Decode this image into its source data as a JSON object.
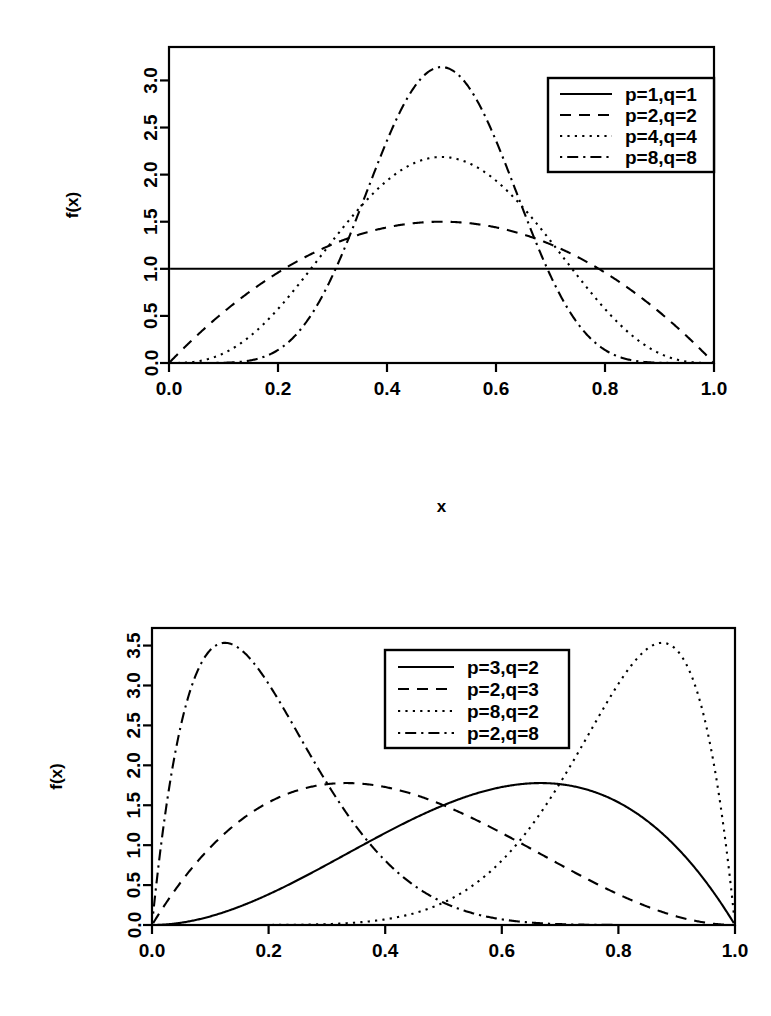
{
  "figures": [
    {
      "id": "beta-symmetric",
      "xlabel": "x",
      "ylabel": "f(x)",
      "xticks": [
        "0.0",
        "0.2",
        "0.4",
        "0.6",
        "0.8",
        "1.0"
      ],
      "yticks": [
        "0.0",
        "0.5",
        "1.0",
        "1.5",
        "2.0",
        "2.5",
        "3.0"
      ],
      "legend": [
        {
          "label": "p=1,q=1",
          "style": "solid"
        },
        {
          "label": "p=2,q=2",
          "style": "dashed"
        },
        {
          "label": "p=4,q=4",
          "style": "dotted"
        },
        {
          "label": "p=8,q=8",
          "style": "dashdot"
        }
      ]
    },
    {
      "id": "beta-skewed",
      "xlabel": "x",
      "ylabel": "f(x)",
      "xticks": [
        "0.0",
        "0.2",
        "0.4",
        "0.6",
        "0.8",
        "1.0"
      ],
      "yticks": [
        "0.0",
        "0.5",
        "1.0",
        "1.5",
        "2.0",
        "2.5",
        "3.0",
        "3.5"
      ],
      "legend": [
        {
          "label": "p=3,q=2",
          "style": "solid"
        },
        {
          "label": "p=2,q=3",
          "style": "dashed"
        },
        {
          "label": "p=8,q=2",
          "style": "dotted"
        },
        {
          "label": "p=2,q=8",
          "style": "dashdot"
        }
      ]
    }
  ],
  "chart_data": [
    {
      "type": "line",
      "title": "",
      "xlabel": "x",
      "ylabel": "f(x)",
      "xlim": [
        0.0,
        1.0
      ],
      "ylim": [
        0.0,
        3.2
      ],
      "xticks": [
        0.0,
        0.2,
        0.4,
        0.6,
        0.8,
        1.0
      ],
      "yticks": [
        0.0,
        0.5,
        1.0,
        1.5,
        2.0,
        2.5,
        3.0
      ],
      "grid": false,
      "legend_position": "top-right",
      "x": [
        0.0,
        0.05,
        0.1,
        0.15,
        0.2,
        0.25,
        0.3,
        0.35,
        0.4,
        0.45,
        0.5,
        0.55,
        0.6,
        0.65,
        0.7,
        0.75,
        0.8,
        0.85,
        0.9,
        0.95,
        1.0
      ],
      "series": [
        {
          "name": "p=1,q=1",
          "linestyle": "solid",
          "distribution": "Beta(1,1)",
          "peak": 1.0,
          "values": [
            1.0,
            1.0,
            1.0,
            1.0,
            1.0,
            1.0,
            1.0,
            1.0,
            1.0,
            1.0,
            1.0,
            1.0,
            1.0,
            1.0,
            1.0,
            1.0,
            1.0,
            1.0,
            1.0,
            1.0,
            1.0
          ]
        },
        {
          "name": "p=2,q=2",
          "linestyle": "dashed",
          "distribution": "Beta(2,2)",
          "peak": 1.5,
          "values": [
            0.0,
            0.285,
            0.54,
            0.765,
            0.96,
            1.125,
            1.26,
            1.365,
            1.44,
            1.485,
            1.5,
            1.485,
            1.44,
            1.365,
            1.26,
            1.125,
            0.96,
            0.765,
            0.54,
            0.285,
            0.0
          ]
        },
        {
          "name": "p=4,q=4",
          "linestyle": "dotted",
          "distribution": "Beta(4,4)",
          "peak": 2.1875,
          "values": [
            0.0,
            0.03,
            0.2,
            0.51,
            0.92,
            1.35,
            1.73,
            2.0,
            2.15,
            2.19,
            2.1875,
            2.19,
            2.15,
            2.0,
            1.73,
            1.35,
            0.92,
            0.51,
            0.2,
            0.03,
            0.0
          ]
        },
        {
          "name": "p=8,q=8",
          "linestyle": "dashdot",
          "distribution": "Beta(8,8)",
          "peak": 3.1417,
          "values": [
            0.0,
            0.0,
            0.0,
            0.01,
            0.08,
            0.31,
            0.79,
            1.52,
            2.32,
            2.93,
            3.14,
            2.93,
            2.32,
            1.52,
            0.79,
            0.31,
            0.08,
            0.01,
            0.0,
            0.0,
            0.0
          ]
        }
      ]
    },
    {
      "type": "line",
      "title": "",
      "xlabel": "x",
      "ylabel": "f(x)",
      "xlim": [
        0.0,
        1.0
      ],
      "ylim": [
        0.0,
        3.6
      ],
      "xticks": [
        0.0,
        0.2,
        0.4,
        0.6,
        0.8,
        1.0
      ],
      "yticks": [
        0.0,
        0.5,
        1.0,
        1.5,
        2.0,
        2.5,
        3.0,
        3.5
      ],
      "grid": false,
      "legend_position": "top-center",
      "x": [
        0.0,
        0.05,
        0.1,
        0.15,
        0.2,
        0.25,
        0.3,
        0.35,
        0.4,
        0.45,
        0.5,
        0.55,
        0.6,
        0.65,
        0.7,
        0.75,
        0.8,
        0.85,
        0.9,
        0.95,
        1.0
      ],
      "series": [
        {
          "name": "p=3,q=2",
          "linestyle": "solid",
          "distribution": "Beta(3,2)",
          "peak": 1.7778,
          "values": [
            0.0,
            0.029,
            0.108,
            0.229,
            0.384,
            0.563,
            0.756,
            0.956,
            1.152,
            1.336,
            1.5,
            1.634,
            1.728,
            1.775,
            1.764,
            1.688,
            1.536,
            1.301,
            0.972,
            0.541,
            0.0
          ]
        },
        {
          "name": "p=2,q=3",
          "linestyle": "dashed",
          "distribution": "Beta(2,3)",
          "peak": 1.7778,
          "values": [
            0.0,
            0.541,
            0.972,
            1.301,
            1.536,
            1.688,
            1.764,
            1.775,
            1.728,
            1.634,
            1.5,
            1.336,
            1.152,
            0.956,
            0.756,
            0.563,
            0.384,
            0.229,
            0.108,
            0.029,
            0.0
          ]
        },
        {
          "name": "p=8,q=2",
          "linestyle": "dotted",
          "distribution": "Beta(8,2)",
          "peak": 3.5417,
          "values": [
            0.0,
            0.0,
            0.0,
            0.0,
            0.001,
            0.004,
            0.013,
            0.035,
            0.08,
            0.16,
            0.28,
            0.47,
            0.72,
            1.07,
            1.5,
            2.0,
            2.54,
            3.03,
            3.35,
            3.22,
            0.0
          ]
        },
        {
          "name": "p=2,q=8",
          "linestyle": "dashdot",
          "distribution": "Beta(2,8)",
          "peak": 3.5417,
          "values": [
            0.0,
            3.22,
            3.35,
            3.03,
            2.54,
            2.0,
            1.5,
            1.07,
            0.72,
            0.47,
            0.28,
            0.16,
            0.08,
            0.035,
            0.013,
            0.004,
            0.001,
            0.0,
            0.0,
            0.0,
            0.0
          ]
        }
      ]
    }
  ]
}
